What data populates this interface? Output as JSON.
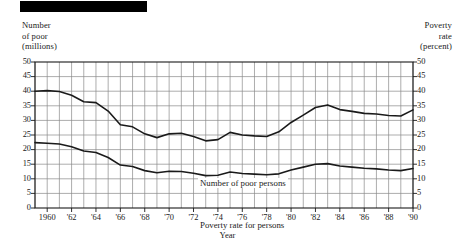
{
  "figure": {
    "black_bar": "solid-black-rule"
  },
  "axis_titles": {
    "left": "Number\nof poor\n(millions)",
    "right": "Poverty\nrate\n(percent)",
    "x": "Year"
  },
  "annotations": {
    "upper_series": "Number of poor persons",
    "lower_series": "Poverty rate for persons"
  },
  "colors": {
    "line": "#1a1a1a",
    "grid": "#8a8a8a",
    "frame": "#1a1a1a",
    "background": "#ffffff",
    "bar": "#000000"
  },
  "chart_data": {
    "type": "line",
    "title": "",
    "xlabel": "Year",
    "ylabel": "Number of poor (millions)",
    "y2label": "Poverty rate (percent)",
    "xlim": [
      1959,
      1990
    ],
    "ylim": [
      0,
      50
    ],
    "y2lim": [
      0,
      50
    ],
    "yticks": [
      0,
      5,
      10,
      15,
      20,
      25,
      30,
      35,
      40,
      45,
      50
    ],
    "y2ticks": [
      0,
      5,
      10,
      15,
      20,
      25,
      30,
      35,
      40,
      45,
      50
    ],
    "ytick_labels": [
      "0",
      "5",
      "10",
      "15",
      "20",
      "25",
      "30",
      "35",
      "40",
      "45",
      "50"
    ],
    "y2tick_labels": [
      "0",
      "5",
      "10",
      "15",
      "20",
      "25",
      "30",
      "35",
      "40",
      "45",
      "50"
    ],
    "x": [
      1959,
      1960,
      1961,
      1962,
      1963,
      1964,
      1965,
      1966,
      1967,
      1968,
      1969,
      1970,
      1971,
      1972,
      1973,
      1974,
      1975,
      1976,
      1977,
      1978,
      1979,
      1980,
      1981,
      1982,
      1983,
      1984,
      1985,
      1986,
      1987,
      1988,
      1989,
      1990
    ],
    "xtick_values": [
      1960,
      1962,
      1964,
      1966,
      1968,
      1970,
      1972,
      1974,
      1976,
      1978,
      1980,
      1982,
      1984,
      1986,
      1988,
      1990
    ],
    "xtick_labels": [
      "1960",
      "'62",
      "'64",
      "'66",
      "'68",
      "'70",
      "'72",
      "'74",
      "'76",
      "'78",
      "'80",
      "'82",
      "'84",
      "'86",
      "'88",
      "'90"
    ],
    "grid": true,
    "grid_vertical_every": 1,
    "grid_horizontal_every": 5,
    "legend": "inline-annotations",
    "series": [
      {
        "name": "Number of poor persons",
        "axis": "left",
        "unit": "millions",
        "values": [
          40.0,
          40.2,
          39.9,
          38.6,
          36.4,
          36.1,
          33.2,
          28.5,
          27.8,
          25.4,
          24.1,
          25.4,
          25.6,
          24.5,
          23.0,
          23.4,
          25.9,
          25.0,
          24.7,
          24.5,
          26.1,
          29.3,
          31.8,
          34.4,
          35.3,
          33.7,
          33.1,
          32.4,
          32.2,
          31.7,
          31.5,
          33.6
        ]
      },
      {
        "name": "Poverty rate for persons",
        "axis": "right",
        "unit": "percent",
        "values": [
          22.4,
          22.2,
          21.9,
          21.0,
          19.5,
          19.0,
          17.3,
          14.7,
          14.2,
          12.8,
          12.1,
          12.6,
          12.5,
          11.9,
          11.1,
          11.2,
          12.3,
          11.8,
          11.6,
          11.4,
          11.7,
          13.0,
          14.0,
          15.0,
          15.2,
          14.4,
          14.0,
          13.6,
          13.4,
          13.0,
          12.8,
          13.5
        ]
      }
    ]
  }
}
